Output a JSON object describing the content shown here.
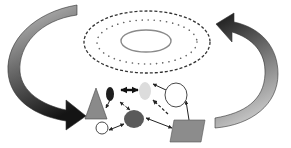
{
  "diagram": {
    "colors": {
      "background": "#ffffff",
      "arrow_dark": "#1a1a1a",
      "arrow_light": "#bdbdbd",
      "triangle": "#8a8a8a",
      "dark_oval": "#1e1e1e",
      "light_oval": "#dcdcdc",
      "dark_circle": "#5a5a5a",
      "parallelogram": "#8c8c8c",
      "outline": "#333333",
      "ellipse_stroke": "#444444",
      "inner_ellipse": "#888888"
    },
    "top_field": {
      "outer_ellipse": "dashed",
      "middle_ellipse": "dotted",
      "inner_ellipse": "solid"
    },
    "nodes": [
      {
        "id": "triangle",
        "shape": "triangle",
        "fill": "gray"
      },
      {
        "id": "dark-oval",
        "shape": "oval",
        "fill": "black"
      },
      {
        "id": "light-oval",
        "shape": "oval",
        "fill": "light-gray"
      },
      {
        "id": "white-circle-large",
        "shape": "circle",
        "fill": "white"
      },
      {
        "id": "white-circle-small",
        "shape": "circle",
        "fill": "white"
      },
      {
        "id": "dark-circle",
        "shape": "circle",
        "fill": "dark-gray"
      },
      {
        "id": "parallelogram",
        "shape": "parallelogram",
        "fill": "gray"
      }
    ],
    "edges": [
      {
        "from": "dark-oval",
        "to": "light-oval",
        "style": "bold-bidirectional"
      },
      {
        "from": "dark-oval",
        "to": "triangle",
        "style": "solid"
      },
      {
        "from": "dark-oval",
        "to": "dark-circle",
        "style": "dashed-bidirectional"
      },
      {
        "from": "white-circle-small",
        "to": "dark-circle",
        "style": "solid-bidirectional"
      },
      {
        "from": "white-circle-large",
        "to": "light-oval",
        "style": "solid"
      },
      {
        "from": "parallelogram",
        "to": "white-circle-large",
        "style": "solid"
      },
      {
        "from": "parallelogram",
        "to": "light-oval",
        "style": "dashed"
      },
      {
        "from": "parallelogram",
        "to": "dark-circle",
        "style": "solid-bidirectional"
      }
    ],
    "cycle_arrows": [
      {
        "id": "left-arrow",
        "direction": "down-right",
        "gradient": "light-to-dark"
      },
      {
        "id": "right-arrow",
        "direction": "up-left",
        "gradient": "light-to-dark"
      }
    ]
  }
}
